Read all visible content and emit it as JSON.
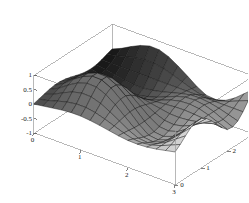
{
  "figure": {
    "kind": "3d-surface-plot",
    "background_color": "#ffffff",
    "frame_color": "#9a9a9a",
    "mesh_color": "#141414",
    "tick_color": "#1a1a1a"
  },
  "chart_data": {
    "type": "surface",
    "title": "",
    "xlabel": "",
    "ylabel": "",
    "zlabel": "",
    "grid": false,
    "legend": "none",
    "projection": "parallel-3d",
    "xlim": [
      0,
      3
    ],
    "ylim": [
      0,
      3
    ],
    "zlim": [
      -1,
      1
    ],
    "x_ticks": [
      0,
      1,
      2,
      3
    ],
    "x_tick_labels": [
      "0",
      "1",
      "2",
      "3"
    ],
    "y_ticks": [
      0,
      1,
      2,
      3
    ],
    "y_tick_labels": [
      "0",
      "1",
      "2",
      "3"
    ],
    "z_ticks": [
      -1,
      -0.5,
      0,
      0.5,
      1
    ],
    "z_tick_labels": [
      "-1",
      "-0.5",
      "0",
      "0.5",
      "1"
    ],
    "nx": 16,
    "ny": 16,
    "shading": "grayscale",
    "surface_description": "Single smooth surface over the unit-square-like domain 0..3 in x and 0..3 in y, rising from a dark near-zero plateau on the near-left to a tall rounded central peak reaching z=1, dipping to a trough near z=-1 right of the peak, then rising again to a second ridge at the far-right corner.",
    "z_surface": [
      [
        0.0,
        0.05,
        0.1,
        0.15,
        0.18,
        0.18,
        0.15,
        0.1,
        0.04,
        -0.02,
        -0.06,
        -0.07,
        -0.05,
        0.0,
        0.07,
        0.14
      ],
      [
        0.05,
        0.12,
        0.22,
        0.31,
        0.36,
        0.36,
        0.3,
        0.2,
        0.08,
        -0.04,
        -0.13,
        -0.15,
        -0.1,
        0.0,
        0.14,
        0.28
      ],
      [
        0.1,
        0.22,
        0.39,
        0.54,
        0.62,
        0.61,
        0.5,
        0.33,
        0.13,
        -0.07,
        -0.22,
        -0.25,
        -0.17,
        0.0,
        0.23,
        0.46
      ],
      [
        0.15,
        0.31,
        0.54,
        0.73,
        0.84,
        0.83,
        0.69,
        0.46,
        0.18,
        -0.1,
        -0.3,
        -0.34,
        -0.23,
        0.0,
        0.31,
        0.62
      ],
      [
        0.18,
        0.36,
        0.62,
        0.84,
        0.97,
        0.96,
        0.8,
        0.53,
        0.21,
        -0.11,
        -0.35,
        -0.39,
        -0.27,
        0.0,
        0.36,
        0.72
      ],
      [
        0.18,
        0.36,
        0.61,
        0.83,
        0.96,
        0.95,
        0.79,
        0.53,
        0.21,
        -0.11,
        -0.35,
        -0.39,
        -0.27,
        0.0,
        0.36,
        0.71
      ],
      [
        0.15,
        0.3,
        0.5,
        0.69,
        0.8,
        0.79,
        0.66,
        0.44,
        0.17,
        -0.09,
        -0.29,
        -0.32,
        -0.22,
        0.0,
        0.3,
        0.59
      ],
      [
        0.1,
        0.2,
        0.33,
        0.46,
        0.53,
        0.53,
        0.44,
        0.29,
        0.11,
        -0.06,
        -0.19,
        -0.22,
        -0.15,
        0.0,
        0.2,
        0.39
      ],
      [
        0.04,
        0.08,
        0.13,
        0.18,
        0.21,
        0.21,
        0.17,
        0.11,
        0.04,
        -0.02,
        -0.08,
        -0.09,
        -0.06,
        0.0,
        0.08,
        0.16
      ],
      [
        -0.02,
        -0.04,
        -0.07,
        -0.1,
        -0.11,
        -0.11,
        -0.09,
        -0.06,
        -0.02,
        0.01,
        0.04,
        0.05,
        0.03,
        0.0,
        -0.04,
        -0.08
      ],
      [
        -0.06,
        -0.13,
        -0.22,
        -0.3,
        -0.35,
        -0.35,
        -0.29,
        -0.19,
        -0.08,
        0.04,
        0.12,
        0.14,
        0.1,
        0.0,
        -0.13,
        -0.26
      ],
      [
        -0.07,
        -0.15,
        -0.25,
        -0.34,
        -0.39,
        -0.39,
        -0.32,
        -0.22,
        -0.09,
        0.05,
        0.14,
        0.16,
        0.11,
        0.0,
        -0.15,
        -0.29
      ],
      [
        -0.05,
        -0.1,
        -0.17,
        -0.23,
        -0.27,
        -0.27,
        -0.22,
        -0.15,
        -0.06,
        0.03,
        0.1,
        0.11,
        0.07,
        0.0,
        -0.1,
        -0.2
      ],
      [
        0.0,
        0.0,
        0.0,
        0.0,
        0.0,
        0.0,
        0.0,
        0.0,
        0.0,
        0.0,
        0.0,
        0.0,
        0.0,
        0.0,
        0.0,
        0.0
      ],
      [
        0.07,
        0.14,
        0.23,
        0.31,
        0.36,
        0.36,
        0.3,
        0.2,
        0.08,
        -0.04,
        -0.13,
        -0.15,
        -0.1,
        0.0,
        0.14,
        0.27
      ],
      [
        0.14,
        0.28,
        0.46,
        0.62,
        0.72,
        0.71,
        0.59,
        0.39,
        0.16,
        -0.08,
        -0.26,
        -0.29,
        -0.2,
        0.0,
        0.27,
        0.54
      ]
    ]
  }
}
